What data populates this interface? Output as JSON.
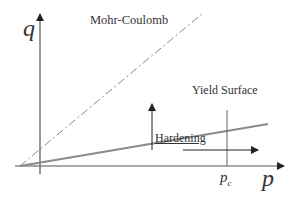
{
  "diagram": {
    "axes": {
      "y_label": "q",
      "x_label": "p"
    },
    "labels": {
      "mohr_coulomb": "Mohr-Coulomb",
      "yield_surface": "Yield Surface",
      "hardening": "Hardening",
      "pc_main": "p",
      "pc_sub": "c"
    },
    "colors": {
      "axis": "#555555",
      "yield_surface": "#8a8a8a",
      "mohr_coulomb": "#888888",
      "text": "#333333"
    }
  }
}
